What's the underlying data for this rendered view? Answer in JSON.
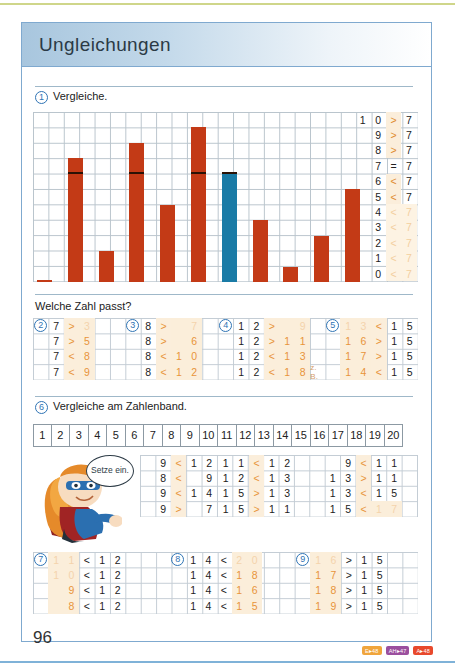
{
  "page": {
    "title": "Ungleichungen",
    "page_number": "96",
    "badges": [
      {
        "label": "E▸48",
        "color": "#f0a53c"
      },
      {
        "label": "AH▸47",
        "color": "#9b4f9e"
      },
      {
        "label": "A▸48",
        "color": "#e8492c"
      }
    ]
  },
  "task1": {
    "number": "1",
    "label": "Vergleiche.",
    "comparison_rows": [
      {
        "left": "1 0",
        "sign": ">",
        "right": "7",
        "faint": false
      },
      {
        "left": "9",
        "sign": ">",
        "right": "7",
        "faint": false
      },
      {
        "left": "8",
        "sign": ">",
        "right": "7",
        "faint": false
      },
      {
        "left": "7",
        "sign": "=",
        "right": "7",
        "faint": false
      },
      {
        "left": "6",
        "sign": "<",
        "right": "7",
        "faint": false
      },
      {
        "left": "5",
        "sign": "<",
        "right": "7",
        "faint": false
      },
      {
        "left": "4",
        "sign": "<",
        "right": "7",
        "faint": true
      },
      {
        "left": "3",
        "sign": "<",
        "right": "7",
        "faint": true
      },
      {
        "left": "2",
        "sign": "<",
        "right": "7",
        "faint": true
      },
      {
        "left": "1",
        "sign": "<",
        "right": "7",
        "faint": true
      },
      {
        "left": "0",
        "sign": "<",
        "right": "7",
        "faint": true
      }
    ]
  },
  "chart_data": {
    "type": "bar",
    "title": "Vergleiche.",
    "xlabel": "",
    "ylabel": "",
    "ylim": [
      0,
      11
    ],
    "grid": true,
    "reference_value": 7,
    "reference_color": "#1a7ba6",
    "bar_color": "#c33a16",
    "categories": [
      "0",
      "8",
      "2",
      "9",
      "5",
      "10",
      "7",
      "4",
      "1",
      "3",
      "6"
    ],
    "values": [
      0,
      8,
      2,
      9,
      5,
      10,
      7,
      4,
      1,
      3,
      6
    ],
    "highlight_index": 6,
    "note": "Dark marker line drawn at height 7 across each bar reaching it"
  },
  "welche": {
    "heading": "Welche Zahl passt?",
    "task2": {
      "number": "2",
      "rows": [
        {
          "cells": [
            "7"
          ],
          "sign": ">",
          "answer": [
            "3"
          ],
          "answer_faint": true
        },
        {
          "cells": [
            "7"
          ],
          "sign": ">",
          "answer": [
            "5"
          ],
          "answer_faint": false
        },
        {
          "cells": [
            "7"
          ],
          "sign": "<",
          "answer": [
            "8"
          ],
          "answer_faint": false
        },
        {
          "cells": [
            "7"
          ],
          "sign": "<",
          "answer": [
            "9"
          ],
          "answer_faint": false
        }
      ]
    },
    "task3": {
      "number": "3",
      "rows": [
        {
          "cells": [
            "8"
          ],
          "sign": ">",
          "answer": [
            "",
            "7"
          ],
          "answer_faint": true
        },
        {
          "cells": [
            "8"
          ],
          "sign": ">",
          "answer": [
            "",
            "6"
          ],
          "answer_faint": false
        },
        {
          "cells": [
            "8"
          ],
          "sign": "<",
          "answer": [
            "1",
            "0"
          ],
          "answer_faint": false
        },
        {
          "cells": [
            "8"
          ],
          "sign": "<",
          "answer": [
            "1",
            "2"
          ],
          "answer_faint": false
        }
      ]
    },
    "task4": {
      "number": "4",
      "rows": [
        {
          "cells": [
            "1",
            "2"
          ],
          "sign": ">",
          "answer": [
            "",
            "9"
          ],
          "answer_faint": true,
          "note": ""
        },
        {
          "cells": [
            "1",
            "2"
          ],
          "sign": ">",
          "answer": [
            "1",
            "1"
          ],
          "answer_faint": false,
          "note": ""
        },
        {
          "cells": [
            "1",
            "2"
          ],
          "sign": "<",
          "answer": [
            "1",
            "3"
          ],
          "answer_faint": false,
          "note": ""
        },
        {
          "cells": [
            "1",
            "2"
          ],
          "sign": "<",
          "answer": [
            "1",
            "8"
          ],
          "answer_faint": false,
          "note": "z. B."
        }
      ]
    },
    "task5": {
      "number": "5",
      "rows": [
        {
          "answer": [
            "1",
            "3"
          ],
          "sign": "<",
          "cells": [
            "1",
            "5"
          ],
          "answer_faint": true
        },
        {
          "answer": [
            "1",
            "6"
          ],
          "sign": ">",
          "cells": [
            "1",
            "5"
          ],
          "answer_faint": false
        },
        {
          "answer": [
            "1",
            "7"
          ],
          "sign": ">",
          "cells": [
            "1",
            "5"
          ],
          "answer_faint": false
        },
        {
          "answer": [
            "1",
            "4"
          ],
          "sign": "<",
          "cells": [
            "1",
            "5"
          ],
          "answer_faint": false
        }
      ]
    }
  },
  "task6": {
    "number": "6",
    "label": "Vergleiche am Zahlenband.",
    "band": [
      "1",
      "2",
      "3",
      "4",
      "5",
      "6",
      "7",
      "8",
      "9",
      "10",
      "11",
      "12",
      "13",
      "14",
      "15",
      "16",
      "17",
      "18",
      "19",
      "20"
    ],
    "bubble_text": "Setze ein.",
    "columns": [
      {
        "rows": [
          {
            "left": [
              "",
              "9"
            ],
            "sign": "<",
            "right": [
              "1",
              "2"
            ]
          },
          {
            "left": [
              "",
              "8"
            ],
            "sign": "<",
            "right": [
              "",
              "9"
            ]
          },
          {
            "left": [
              "",
              "9"
            ],
            "sign": "<",
            "right": [
              "1",
              "4"
            ]
          },
          {
            "left": [
              "",
              "9"
            ],
            "sign": ">",
            "right": [
              "",
              "7"
            ]
          }
        ]
      },
      {
        "rows": [
          {
            "left": [
              "1",
              "1"
            ],
            "sign": "<",
            "right": [
              "1",
              "2"
            ]
          },
          {
            "left": [
              "1",
              "2"
            ],
            "sign": "<",
            "right": [
              "1",
              "3"
            ]
          },
          {
            "left": [
              "1",
              "5"
            ],
            "sign": ">",
            "right": [
              "1",
              "3"
            ]
          },
          {
            "left": [
              "1",
              "5"
            ],
            "sign": ">",
            "right": [
              "1",
              "1"
            ]
          }
        ]
      },
      {
        "rows": [
          {
            "left": [
              "",
              "9"
            ],
            "sign": "<",
            "right": [
              "1",
              "1"
            ],
            "right_faint": false
          },
          {
            "left": [
              "1",
              "3"
            ],
            "sign": ">",
            "right": [
              "1",
              "1"
            ],
            "right_faint": false
          },
          {
            "left": [
              "1",
              "3"
            ],
            "sign": "<",
            "right": [
              "1",
              "5"
            ],
            "right_faint": false
          },
          {
            "left": [
              "1",
              "5"
            ],
            "sign": "<",
            "right": [
              "1",
              "7"
            ],
            "right_faint": true
          }
        ]
      }
    ]
  },
  "bottom": {
    "task7": {
      "number": "7",
      "rows": [
        {
          "answer": [
            "1",
            "1"
          ],
          "answer_faint": true,
          "sign": "<",
          "cells": [
            "1",
            "2"
          ]
        },
        {
          "answer": [
            "1",
            "0"
          ],
          "answer_faint": true,
          "sign": "<",
          "cells": [
            "1",
            "2"
          ]
        },
        {
          "answer": [
            "",
            "9"
          ],
          "answer_faint": false,
          "sign": "<",
          "cells": [
            "1",
            "2"
          ]
        },
        {
          "answer": [
            "",
            "8"
          ],
          "answer_faint": false,
          "sign": "<",
          "cells": [
            "1",
            "2"
          ]
        }
      ]
    },
    "task8": {
      "number": "8",
      "rows": [
        {
          "cells": [
            "1",
            "4"
          ],
          "sign": "<",
          "answer": [
            "2",
            "0"
          ],
          "answer_faint": true
        },
        {
          "cells": [
            "1",
            "4"
          ],
          "sign": "<",
          "answer": [
            "1",
            "8"
          ],
          "answer_faint": false
        },
        {
          "cells": [
            "1",
            "4"
          ],
          "sign": "<",
          "answer": [
            "1",
            "6"
          ],
          "answer_faint": false
        },
        {
          "cells": [
            "1",
            "4"
          ],
          "sign": "<",
          "answer": [
            "1",
            "5"
          ],
          "answer_faint": false
        }
      ]
    },
    "task9": {
      "number": "9",
      "rows": [
        {
          "answer": [
            "1",
            "6"
          ],
          "answer_faint": true,
          "sign": ">",
          "cells": [
            "1",
            "5"
          ]
        },
        {
          "answer": [
            "1",
            "7"
          ],
          "answer_faint": false,
          "sign": ">",
          "cells": [
            "1",
            "5"
          ]
        },
        {
          "answer": [
            "1",
            "8"
          ],
          "answer_faint": false,
          "sign": ">",
          "cells": [
            "1",
            "5"
          ]
        },
        {
          "answer": [
            "1",
            "9"
          ],
          "answer_faint": false,
          "sign": ">",
          "cells": [
            "1",
            "5"
          ]
        }
      ]
    }
  }
}
